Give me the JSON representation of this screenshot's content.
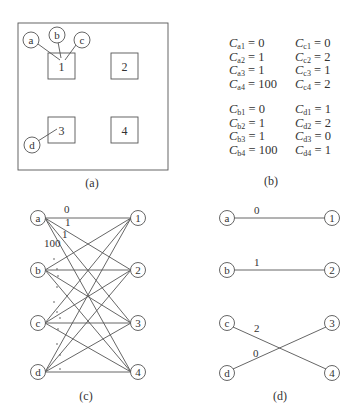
{
  "panels": {
    "a": {
      "caption": "(a)",
      "boxes": [
        {
          "label": "1",
          "x": 48,
          "y": 53,
          "w": 27,
          "h": 26
        },
        {
          "label": "2",
          "x": 111,
          "y": 53,
          "w": 27,
          "h": 26
        },
        {
          "label": "3",
          "x": 48,
          "y": 117,
          "w": 27,
          "h": 26
        },
        {
          "label": "4",
          "x": 111,
          "y": 117,
          "w": 27,
          "h": 26
        }
      ],
      "nodes": [
        {
          "label": "a",
          "cx": 31,
          "cy": 40
        },
        {
          "label": "b",
          "cx": 57,
          "cy": 35
        },
        {
          "label": "c",
          "cx": 82,
          "cy": 40
        },
        {
          "label": "d",
          "cx": 32,
          "cy": 145
        }
      ]
    },
    "b": {
      "caption": "(b)",
      "costs": {
        "left_top": [
          [
            "a",
            "1",
            "0"
          ],
          [
            "a",
            "2",
            "1"
          ],
          [
            "a",
            "3",
            "1"
          ],
          [
            "a",
            "4",
            "100"
          ]
        ],
        "right_top": [
          [
            "c",
            "1",
            "0"
          ],
          [
            "c",
            "2",
            "2"
          ],
          [
            "c",
            "3",
            "1"
          ],
          [
            "c",
            "4",
            "2"
          ]
        ],
        "left_bot": [
          [
            "b",
            "1",
            "0"
          ],
          [
            "b",
            "2",
            "1"
          ],
          [
            "b",
            "3",
            "1"
          ],
          [
            "b",
            "4",
            "100"
          ]
        ],
        "right_bot": [
          [
            "d",
            "1",
            "1"
          ],
          [
            "d",
            "2",
            "2"
          ],
          [
            "d",
            "3",
            "0"
          ],
          [
            "d",
            "4",
            "1"
          ]
        ]
      }
    },
    "c": {
      "caption": "(c)",
      "left_nodes": [
        "a",
        "b",
        "c",
        "d"
      ],
      "right_nodes": [
        "1",
        "2",
        "3",
        "4"
      ],
      "edge_labels": [
        "0",
        "1",
        "1",
        "100"
      ]
    },
    "d": {
      "caption": "(d)",
      "left_nodes": [
        "a",
        "b",
        "c",
        "d"
      ],
      "right_nodes": [
        "1",
        "2",
        "3",
        "4"
      ],
      "matching": [
        {
          "from": "a",
          "to": "1",
          "cost": "0"
        },
        {
          "from": "b",
          "to": "2",
          "cost": "1"
        },
        {
          "from": "c",
          "to": "4",
          "cost": "2"
        },
        {
          "from": "d",
          "to": "3",
          "cost": "0"
        }
      ]
    }
  }
}
